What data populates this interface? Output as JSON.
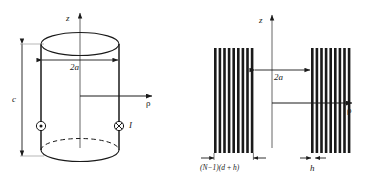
{
  "figure": {
    "background_color": "#ffffff",
    "line_color": "#1a1a1a",
    "panels": [
      {
        "id": "left-panel",
        "name": "cylindrical-solenoid-model",
        "axes": {
          "vertical_label": "z",
          "horizontal_label": "ρ"
        },
        "dimensions": [
          {
            "name": "diameter",
            "label": "2a"
          },
          {
            "name": "height",
            "label": "c"
          }
        ],
        "current_symbols": [
          {
            "name": "current-out-of-page",
            "glyph": "⊙",
            "side": "left"
          },
          {
            "name": "current-into-page",
            "glyph": "⊗",
            "side": "right"
          }
        ],
        "current_label": "I"
      },
      {
        "id": "right-panel",
        "name": "discrete-turns-cross-section",
        "axes": {
          "vertical_label": "z",
          "horizontal_label": "ρ"
        },
        "dimensions": [
          {
            "name": "diameter",
            "label": "2a"
          },
          {
            "name": "winding-width",
            "label": "(N−1)(d + h)"
          },
          {
            "name": "turn-thickness",
            "label": "h"
          }
        ],
        "turn_count_left": 9,
        "turn_count_right": 9
      }
    ]
  }
}
